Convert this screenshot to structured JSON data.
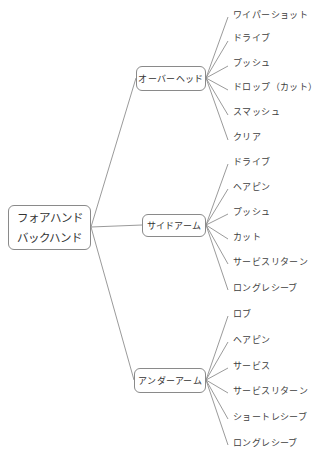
{
  "root": {
    "line1": "フォアハンド",
    "line2": "バックハンド"
  },
  "branches": [
    {
      "label": "オーバーヘッド",
      "leaves": [
        "ワイパーショット",
        "ドライブ",
        "プッシュ",
        "ドロップ（カット）",
        "スマッシュ",
        "クリア"
      ]
    },
    {
      "label": "サイドアーム",
      "leaves": [
        "ドライブ",
        "ヘアピン",
        "プッシュ",
        "カット",
        "サービスリターン",
        "ロングレシーブ"
      ]
    },
    {
      "label": "アンダーアーム",
      "leaves": [
        "ロブ",
        "ヘアピン",
        "サービス",
        "サービスリターン",
        "ショートレシーブ",
        "ロングレシーブ"
      ]
    }
  ],
  "colors": {
    "line": "#8a8a8a",
    "border": "#8a8a8a",
    "text": "#3f3f3f"
  }
}
